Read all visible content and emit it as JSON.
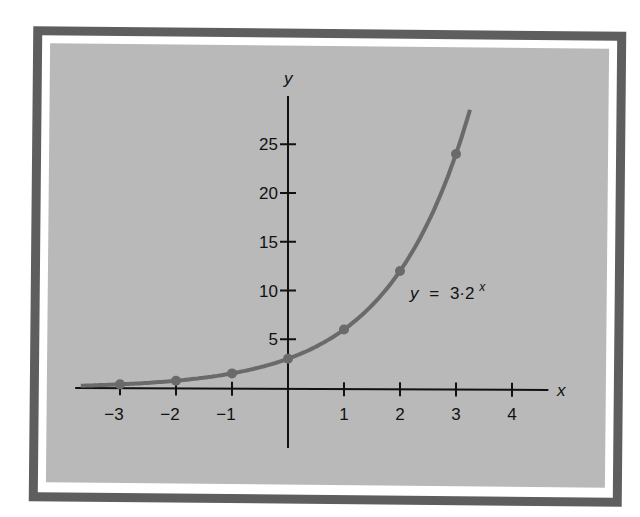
{
  "chart_data": {
    "type": "line",
    "title": "",
    "xlabel": "x",
    "ylabel": "y",
    "function_label": {
      "lhs": "y",
      "eq": "=",
      "rhs_base": "3·2",
      "rhs_exp": "x"
    },
    "xlim": [
      -3.8,
      4.7
    ],
    "ylim": [
      -6.5,
      29.5
    ],
    "x_ticks": [
      -3,
      -2,
      -1,
      1,
      2,
      3,
      4
    ],
    "x_tick_labels": [
      "−3",
      "−2",
      "−1",
      "1",
      "2",
      "3",
      "4"
    ],
    "y_ticks": [
      5,
      10,
      15,
      20,
      25
    ],
    "y_tick_labels": [
      "5",
      "10",
      "15",
      "20",
      "25"
    ],
    "grid": false,
    "series": [
      {
        "name": "y = 3·2^x",
        "formula": "3*2^x",
        "x_range": [
          -3.7,
          3.25
        ],
        "points": [
          {
            "x": -3,
            "y": 0.375
          },
          {
            "x": -2,
            "y": 0.75
          },
          {
            "x": -1,
            "y": 1.5
          },
          {
            "x": 0,
            "y": 3
          },
          {
            "x": 1,
            "y": 6
          },
          {
            "x": 2,
            "y": 12
          },
          {
            "x": 3,
            "y": 24
          }
        ],
        "color": "#6a6a6a"
      }
    ]
  },
  "colors": {
    "frame": "#5e5e5e",
    "panel": "#b9b9b9",
    "axis": "#111111",
    "curve": "#6a6a6a"
  }
}
